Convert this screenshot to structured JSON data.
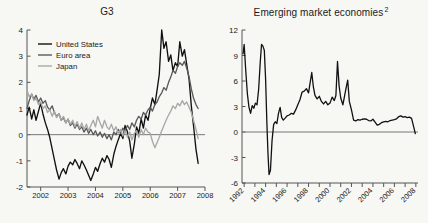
{
  "figure": {
    "background_color": "#f7f7f4",
    "panels": [
      "g3",
      "eme"
    ]
  },
  "panel_left": {
    "title": "G3",
    "title_superscript": ""
  },
  "panel_right": {
    "title": "Emerging market economies",
    "title_superscript": "2"
  },
  "colors": {
    "united_states": "#111111",
    "euro_area": "#5a5a5a",
    "japan": "#a8a8a8",
    "axis": "#555555",
    "zero_line": "#777777",
    "background": "#f7f7f4",
    "text": "#1a1a1a"
  },
  "chart_data": [
    {
      "type": "line",
      "title": "G3",
      "xlabel": "",
      "ylabel": "",
      "xlim": [
        2001.5,
        2008.0
      ],
      "ylim": [
        -2,
        4
      ],
      "yticks": [
        -2,
        -1,
        0,
        1,
        2,
        3,
        4
      ],
      "ytick_labels": [
        "-2",
        "-1",
        "0",
        "1",
        "2",
        "3",
        "4"
      ],
      "xticks": [
        2002,
        2003,
        2004,
        2005,
        2006,
        2007,
        2008
      ],
      "xtick_labels": [
        "2002",
        "2003",
        "2004",
        "2005",
        "2006",
        "2007",
        "2008"
      ],
      "grid": false,
      "zero_line": true,
      "legend_position": "top-left",
      "series": [
        {
          "name": "United States",
          "color": "#111111",
          "x": [
            2001.5,
            2001.58,
            2001.67,
            2001.75,
            2001.83,
            2001.92,
            2002.0,
            2002.08,
            2002.17,
            2002.25,
            2002.33,
            2002.42,
            2002.5,
            2002.58,
            2002.67,
            2002.75,
            2002.83,
            2002.92,
            2003.0,
            2003.08,
            2003.17,
            2003.25,
            2003.33,
            2003.42,
            2003.5,
            2003.58,
            2003.67,
            2003.75,
            2003.83,
            2003.92,
            2004.0,
            2004.08,
            2004.17,
            2004.25,
            2004.33,
            2004.42,
            2004.5,
            2004.58,
            2004.67,
            2004.75,
            2004.83,
            2004.92,
            2005.0,
            2005.08,
            2005.17,
            2005.25,
            2005.33,
            2005.42,
            2005.5,
            2005.58,
            2005.67,
            2005.75,
            2005.83,
            2005.92,
            2006.0,
            2006.08,
            2006.17,
            2006.25,
            2006.33,
            2006.42,
            2006.5,
            2006.58,
            2006.67,
            2006.75,
            2006.83,
            2006.92,
            2007.0,
            2007.08,
            2007.17,
            2007.25,
            2007.33,
            2007.42,
            2007.5,
            2007.58,
            2007.67,
            2007.75
          ],
          "y": [
            0.75,
            1.05,
            0.6,
            0.95,
            0.55,
            0.9,
            1.2,
            0.8,
            0.45,
            0.2,
            -0.1,
            -0.55,
            -0.95,
            -1.35,
            -1.7,
            -1.45,
            -1.3,
            -1.5,
            -1.2,
            -1.05,
            -1.15,
            -0.95,
            -1.1,
            -1.3,
            -1.0,
            -1.15,
            -1.35,
            -1.55,
            -1.75,
            -1.5,
            -1.25,
            -1.4,
            -1.1,
            -0.9,
            -1.05,
            -0.8,
            -0.95,
            -1.25,
            -0.75,
            -0.45,
            -0.2,
            0.05,
            -0.15,
            0.35,
            0.1,
            -0.25,
            -0.9,
            -0.35,
            0.3,
            0.05,
            0.6,
            0.25,
            0.75,
            0.55,
            1.0,
            1.4,
            1.15,
            1.7,
            2.3,
            4.0,
            3.3,
            3.55,
            2.8,
            3.05,
            2.45,
            2.75,
            2.6,
            3.55,
            3.0,
            3.25,
            2.7,
            2.1,
            1.1,
            0.35,
            -0.55,
            -1.1
          ]
        },
        {
          "name": "Euro area",
          "color": "#5a5a5a",
          "x": [
            2001.5,
            2001.58,
            2001.67,
            2001.75,
            2001.83,
            2001.92,
            2002.0,
            2002.08,
            2002.17,
            2002.25,
            2002.33,
            2002.42,
            2002.5,
            2002.58,
            2002.67,
            2002.75,
            2002.83,
            2002.92,
            2003.0,
            2003.08,
            2003.17,
            2003.25,
            2003.33,
            2003.42,
            2003.5,
            2003.58,
            2003.67,
            2003.75,
            2003.83,
            2003.92,
            2004.0,
            2004.08,
            2004.17,
            2004.25,
            2004.33,
            2004.42,
            2004.5,
            2004.58,
            2004.67,
            2004.75,
            2004.83,
            2004.92,
            2005.0,
            2005.08,
            2005.17,
            2005.25,
            2005.33,
            2005.42,
            2005.5,
            2005.58,
            2005.67,
            2005.75,
            2005.83,
            2005.92,
            2006.0,
            2006.08,
            2006.17,
            2006.25,
            2006.33,
            2006.42,
            2006.5,
            2006.58,
            2006.67,
            2006.75,
            2006.83,
            2006.92,
            2007.0,
            2007.08,
            2007.17,
            2007.25,
            2007.33,
            2007.42,
            2007.5,
            2007.58,
            2007.67,
            2007.75
          ],
          "y": [
            1.0,
            1.3,
            1.55,
            1.35,
            1.5,
            1.25,
            1.4,
            1.2,
            1.3,
            1.05,
            0.95,
            1.1,
            0.85,
            0.7,
            0.8,
            0.55,
            0.65,
            0.45,
            0.6,
            0.35,
            0.45,
            0.25,
            0.4,
            0.2,
            0.3,
            0.1,
            0.25,
            0.05,
            0.2,
            0.0,
            0.15,
            -0.05,
            0.1,
            -0.1,
            0.05,
            -0.15,
            0.0,
            -0.2,
            0.1,
            0.0,
            0.2,
            0.05,
            0.25,
            0.15,
            0.35,
            0.2,
            0.45,
            0.3,
            0.55,
            0.7,
            0.6,
            0.85,
            0.75,
            0.95,
            1.05,
            0.9,
            1.15,
            1.25,
            1.45,
            1.6,
            1.8,
            1.7,
            2.0,
            2.2,
            2.45,
            2.35,
            2.6,
            2.75,
            2.65,
            2.8,
            2.55,
            2.2,
            1.75,
            1.4,
            1.15,
            1.0
          ]
        },
        {
          "name": "Japan",
          "color": "#a8a8a8",
          "x": [
            2001.5,
            2001.58,
            2001.67,
            2001.75,
            2001.83,
            2001.92,
            2002.0,
            2002.08,
            2002.17,
            2002.25,
            2002.33,
            2002.42,
            2002.5,
            2002.58,
            2002.67,
            2002.75,
            2002.83,
            2002.92,
            2003.0,
            2003.08,
            2003.17,
            2003.25,
            2003.33,
            2003.42,
            2003.5,
            2003.58,
            2003.67,
            2003.75,
            2003.83,
            2003.92,
            2004.0,
            2004.08,
            2004.17,
            2004.25,
            2004.33,
            2004.42,
            2004.5,
            2004.58,
            2004.67,
            2004.75,
            2004.83,
            2004.92,
            2005.0,
            2005.08,
            2005.17,
            2005.25,
            2005.33,
            2005.42,
            2005.5,
            2005.58,
            2005.67,
            2005.75,
            2005.83,
            2005.92,
            2006.0,
            2006.08,
            2006.17,
            2006.25,
            2006.33,
            2006.42,
            2006.5,
            2006.58,
            2006.67,
            2006.75,
            2006.83,
            2006.92,
            2007.0,
            2007.08,
            2007.17,
            2007.25,
            2007.33,
            2007.42,
            2007.5,
            2007.58,
            2007.67,
            2007.75
          ],
          "y": [
            1.7,
            1.45,
            1.55,
            1.3,
            1.4,
            1.15,
            1.25,
            1.0,
            1.1,
            0.85,
            0.95,
            0.7,
            0.9,
            0.65,
            0.8,
            0.55,
            0.7,
            0.45,
            0.6,
            0.4,
            0.55,
            0.3,
            0.5,
            0.25,
            0.45,
            0.2,
            0.4,
            0.15,
            0.35,
            0.55,
            0.3,
            0.7,
            0.45,
            0.25,
            0.55,
            0.3,
            0.2,
            0.4,
            0.15,
            0.3,
            0.05,
            0.2,
            -0.05,
            0.15,
            -0.1,
            0.1,
            -0.2,
            0.05,
            0.15,
            -0.1,
            0.2,
            0.0,
            0.25,
            0.1,
            0.05,
            -0.25,
            -0.5,
            -0.3,
            -0.1,
            0.15,
            0.35,
            0.55,
            0.75,
            0.9,
            1.1,
            1.0,
            1.2,
            1.1,
            1.3,
            1.15,
            1.25,
            1.05,
            0.85,
            0.55,
            0.2,
            -0.15
          ]
        }
      ]
    },
    {
      "type": "line",
      "title": "Emerging market economies",
      "title_superscript": "2",
      "xlabel": "",
      "ylabel": "",
      "xlim": [
        1991.8,
        2008.2
      ],
      "ylim": [
        -6,
        12
      ],
      "yticks": [
        -6,
        -3,
        0,
        3,
        6,
        9,
        12
      ],
      "ytick_labels": [
        "-6",
        "-3",
        "0",
        "3",
        "6",
        "9",
        "12"
      ],
      "xticks": [
        1992,
        1994,
        1996,
        1998,
        2000,
        2002,
        2004,
        2006,
        2008
      ],
      "xtick_labels": [
        "1992",
        "1994",
        "1996",
        "1998",
        "2000",
        "2002",
        "2004",
        "2006",
        "2008"
      ],
      "xticks_minor": [
        1993,
        1995,
        1997,
        1999,
        2001,
        2003,
        2005,
        2007
      ],
      "grid": false,
      "zero_line": true,
      "legend_position": "none",
      "series": [
        {
          "name": "Emerging market economies",
          "color": "#111111",
          "x": [
            1991.9,
            1992.0,
            1992.15,
            1992.3,
            1992.45,
            1992.6,
            1992.75,
            1992.9,
            1993.05,
            1993.2,
            1993.35,
            1993.5,
            1993.62,
            1993.75,
            1993.88,
            1994.0,
            1994.12,
            1994.22,
            1994.32,
            1994.45,
            1994.6,
            1994.75,
            1994.9,
            1995.05,
            1995.2,
            1995.35,
            1995.5,
            1995.65,
            1995.8,
            1996.0,
            1996.2,
            1996.4,
            1996.6,
            1996.8,
            1997.0,
            1997.2,
            1997.4,
            1997.6,
            1997.8,
            1998.0,
            1998.15,
            1998.3,
            1998.45,
            1998.6,
            1998.8,
            1999.0,
            1999.2,
            1999.4,
            1999.6,
            1999.8,
            2000.0,
            2000.2,
            2000.4,
            2000.55,
            2000.7,
            2000.85,
            2001.0,
            2001.2,
            2001.35,
            2001.5,
            2001.65,
            2001.8,
            2002.0,
            2002.2,
            2002.4,
            2002.6,
            2002.8,
            2003.0,
            2003.2,
            2003.4,
            2003.6,
            2003.8,
            2004.0,
            2004.2,
            2004.4,
            2004.6,
            2004.8,
            2005.0,
            2005.2,
            2005.4,
            2005.6,
            2005.8,
            2006.0,
            2006.2,
            2006.4,
            2006.6,
            2006.8,
            2007.0,
            2007.2,
            2007.4,
            2007.6,
            2007.8,
            2007.95
          ],
          "y": [
            9.2,
            10.3,
            7.2,
            4.5,
            2.9,
            2.2,
            3.1,
            2.8,
            3.4,
            3.2,
            5.0,
            8.2,
            10.3,
            10.1,
            9.6,
            6.2,
            1.0,
            -2.5,
            -5.0,
            -4.5,
            -1.0,
            0.9,
            1.2,
            1.0,
            2.2,
            2.9,
            1.7,
            1.4,
            1.6,
            1.9,
            2.0,
            2.2,
            2.1,
            2.6,
            3.2,
            3.8,
            4.7,
            4.8,
            5.1,
            4.6,
            5.8,
            7.0,
            5.3,
            4.3,
            3.9,
            4.2,
            3.6,
            3.3,
            3.6,
            3.2,
            3.4,
            4.1,
            3.7,
            4.3,
            8.3,
            5.4,
            4.0,
            3.2,
            4.2,
            5.2,
            6.1,
            3.6,
            2.6,
            1.4,
            1.3,
            1.45,
            1.4,
            1.5,
            1.55,
            1.5,
            1.35,
            1.3,
            1.5,
            1.15,
            0.8,
            0.9,
            1.1,
            1.2,
            1.25,
            1.2,
            1.35,
            1.4,
            1.45,
            1.55,
            1.8,
            1.9,
            1.75,
            1.8,
            1.7,
            1.75,
            1.6,
            0.6,
            -0.2
          ]
        }
      ]
    }
  ],
  "legend": {
    "items": [
      {
        "label": "United States",
        "color": "#111111"
      },
      {
        "label": "Euro area",
        "color": "#5a5a5a"
      },
      {
        "label": "Japan",
        "color": "#a8a8a8"
      }
    ]
  }
}
